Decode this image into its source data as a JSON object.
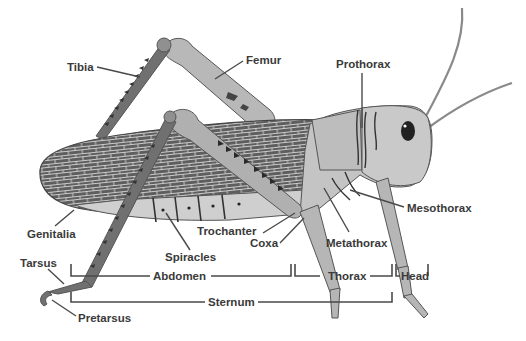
{
  "diagram": {
    "colors": {
      "background": "#ffffff",
      "body_light": "#c8c8c8",
      "body_mid": "#a9a9a9",
      "wing_dark": "#5e5e5e",
      "wing_vein": "#d8d8d8",
      "label_text": "#3a3a3a",
      "leader_line": "#4a4a4a"
    },
    "labels": {
      "tibia": "Tibia",
      "femur": "Femur",
      "prothorax": "Prothorax",
      "mesothorax": "Mesothorax",
      "metathorax": "Metathorax",
      "trochanter": "Trochanter",
      "coxa": "Coxa",
      "spiracles": "Spiracles",
      "genitalia": "Genitalia",
      "tarsus": "Tarsus",
      "pretarsus": "Pretarsus"
    },
    "regions": {
      "abdomen": "Abdomen",
      "thorax": "Thorax",
      "head": "Head",
      "sternum": "Sternum"
    }
  }
}
